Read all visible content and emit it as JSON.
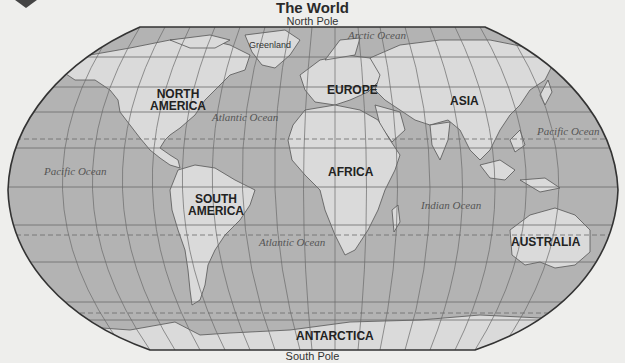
{
  "header": {
    "title": "The World",
    "top_label": "North Pole",
    "bottom_label": "South Pole"
  },
  "continents": {
    "north_america": "NORTH AMERICA",
    "north_america_line1": "NORTH",
    "north_america_line2": "AMERICA",
    "south_america_line1": "SOUTH",
    "south_america_line2": "AMERICA",
    "europe": "EUROPE",
    "asia": "ASIA",
    "africa": "AFRICA",
    "australia": "AUSTRALIA",
    "antarctica": "ANTARCTICA"
  },
  "oceans": {
    "arctic": "Arctic Ocean",
    "atlantic_north": "Atlantic Ocean",
    "atlantic_south": "Atlantic Ocean",
    "pacific_east": "Pacific Ocean",
    "pacific_west": "Pacific Ocean",
    "indian": "Indian Ocean"
  },
  "places": {
    "greenland": "Greenland"
  },
  "colors": {
    "background": "#eeeeec",
    "ocean": "#b3b3b3",
    "land": "#dadada",
    "outline": "#333333",
    "grid": "#6a6a6a"
  }
}
